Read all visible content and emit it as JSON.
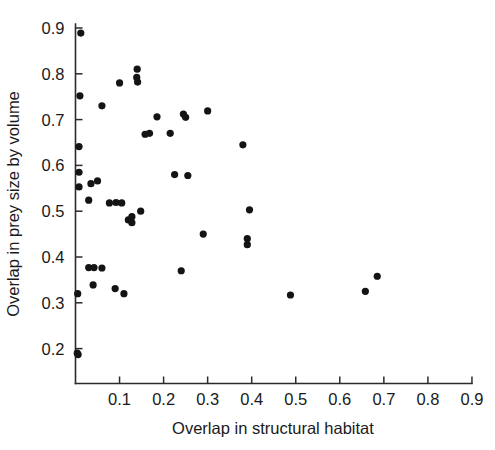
{
  "chart_data": {
    "type": "scatter",
    "title": "",
    "xlabel": "Overlap in structural habitat",
    "ylabel": "Overlap in prey size by volume",
    "xlim": [
      0.0,
      0.9
    ],
    "ylim": [
      0.145,
      0.9
    ],
    "xticks": [
      0.1,
      0.2,
      0.3,
      0.4,
      0.5,
      0.6,
      0.7,
      0.8,
      0.9
    ],
    "yticks": [
      0.2,
      0.3,
      0.4,
      0.5,
      0.6,
      0.7,
      0.8,
      0.9
    ],
    "xtick_labels": [
      "0.1",
      "0.2",
      "0.3",
      "0.4",
      "0.5",
      "0.6",
      "0.7",
      "0.8",
      "0.9"
    ],
    "ytick_labels": [
      "0.2",
      "0.3",
      "0.4",
      "0.5",
      "0.6",
      "0.7",
      "0.8",
      "0.9"
    ],
    "grid": false,
    "legend": null,
    "marker": "filled-circle",
    "marker_color": "#141414",
    "marker_size": 6,
    "n_points": 47,
    "points": [
      {
        "x": 0.012,
        "y": 0.889
      },
      {
        "x": 0.01,
        "y": 0.752
      },
      {
        "x": 0.06,
        "y": 0.73
      },
      {
        "x": 0.008,
        "y": 0.641
      },
      {
        "x": 0.008,
        "y": 0.585
      },
      {
        "x": 0.008,
        "y": 0.553
      },
      {
        "x": 0.035,
        "y": 0.56
      },
      {
        "x": 0.05,
        "y": 0.566
      },
      {
        "x": 0.03,
        "y": 0.524
      },
      {
        "x": 0.03,
        "y": 0.377
      },
      {
        "x": 0.042,
        "y": 0.377
      },
      {
        "x": 0.005,
        "y": 0.32
      },
      {
        "x": 0.04,
        "y": 0.339
      },
      {
        "x": 0.004,
        "y": 0.19
      },
      {
        "x": 0.1,
        "y": 0.78
      },
      {
        "x": 0.14,
        "y": 0.81
      },
      {
        "x": 0.139,
        "y": 0.792
      },
      {
        "x": 0.141,
        "y": 0.782
      },
      {
        "x": 0.185,
        "y": 0.706
      },
      {
        "x": 0.158,
        "y": 0.668
      },
      {
        "x": 0.168,
        "y": 0.67
      },
      {
        "x": 0.215,
        "y": 0.67
      },
      {
        "x": 0.245,
        "y": 0.712
      },
      {
        "x": 0.25,
        "y": 0.705
      },
      {
        "x": 0.3,
        "y": 0.719
      },
      {
        "x": 0.077,
        "y": 0.518
      },
      {
        "x": 0.092,
        "y": 0.519
      },
      {
        "x": 0.105,
        "y": 0.518
      },
      {
        "x": 0.12,
        "y": 0.481
      },
      {
        "x": 0.128,
        "y": 0.475
      },
      {
        "x": 0.148,
        "y": 0.5
      },
      {
        "x": 0.09,
        "y": 0.331
      },
      {
        "x": 0.11,
        "y": 0.32
      },
      {
        "x": 0.225,
        "y": 0.58
      },
      {
        "x": 0.255,
        "y": 0.578
      },
      {
        "x": 0.29,
        "y": 0.45
      },
      {
        "x": 0.24,
        "y": 0.37
      },
      {
        "x": 0.38,
        "y": 0.645
      },
      {
        "x": 0.395,
        "y": 0.503
      },
      {
        "x": 0.39,
        "y": 0.44
      },
      {
        "x": 0.39,
        "y": 0.427
      },
      {
        "x": 0.488,
        "y": 0.317
      },
      {
        "x": 0.658,
        "y": 0.325
      },
      {
        "x": 0.685,
        "y": 0.358
      },
      {
        "x": 0.128,
        "y": 0.488
      },
      {
        "x": 0.06,
        "y": 0.376
      },
      {
        "x": 0.006,
        "y": 0.187
      }
    ]
  },
  "axes": {
    "x_title": "Overlap in structural habitat",
    "y_title": "Overlap in prey size by volume"
  }
}
